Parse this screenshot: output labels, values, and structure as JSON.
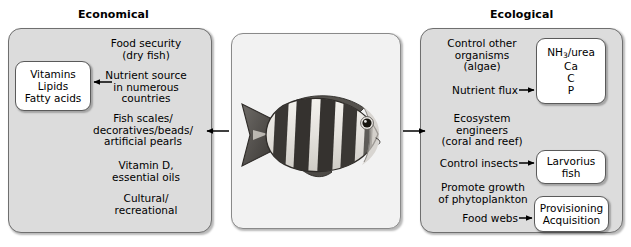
{
  "diagram": {
    "title_left": "Economical",
    "title_right": "Ecological",
    "center": {
      "subject": "fish-illustration",
      "description": "striped fish"
    }
  },
  "economical": {
    "heading": "Economical",
    "items": [
      {
        "id": "food-security",
        "text": "Food security\n(dry fish)"
      },
      {
        "id": "nutrient-source",
        "text": "Nutrient source\nin numerous\ncountries"
      },
      {
        "id": "fish-scales",
        "text": "Fish scales/\ndecoratives/beads/\nartificial pearls"
      },
      {
        "id": "vitamin-d",
        "text": "Vitamin D,\nessential oils"
      },
      {
        "id": "cultural",
        "text": "Cultural/\nrecreational"
      }
    ],
    "nutrient_box": {
      "lines": [
        "Vitamins",
        "Lipids",
        "Fatty acids"
      ]
    }
  },
  "ecological": {
    "heading": "Ecological",
    "items": [
      {
        "id": "control-other-organisms",
        "text": "Control other\norganisms\n(algae)"
      },
      {
        "id": "nutrient-flux",
        "text": "Nutrient flux"
      },
      {
        "id": "ecosystem-engineers",
        "text": "Ecosystem\nengineers\n(coral and reef)"
      },
      {
        "id": "control-insects",
        "text": "Control insects"
      },
      {
        "id": "promote-growth",
        "text": "Promote growth\nof phytoplankton"
      },
      {
        "id": "food-webs",
        "text": "Food webs"
      }
    ],
    "chemical_box": {
      "lines": [
        "NH",
        "3",
        "/urea",
        "Ca",
        "C",
        "P"
      ],
      "line1_main": "NH",
      "line1_sub": "3",
      "line1_rest": "/urea",
      "line2": "Ca",
      "line3": "C",
      "line4": "P"
    },
    "larvorius_box": {
      "lines": [
        "Larvorius",
        "fish"
      ],
      "line1": "Larvorius",
      "line2": "fish"
    },
    "provisioning_box": {
      "lines": [
        "Provisioning",
        "Acquisition"
      ],
      "line1": "Provisioning",
      "line2": "Acquisition"
    }
  },
  "colors": {
    "panel_fill": "#dcdcdc",
    "panel_border": "#6f6f6f",
    "center_fill": "#f2f2f2",
    "box_fill": "#ffffff",
    "text": "#000000",
    "fish_dark": "#3a3a3a",
    "fish_light": "#e8e6e2"
  }
}
